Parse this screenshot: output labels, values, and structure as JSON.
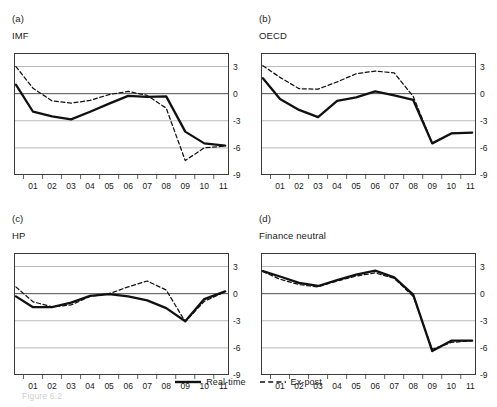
{
  "figure": {
    "caption": "Figure 6.2",
    "legend": [
      {
        "label": "Real-time",
        "style": "solid",
        "color": "#111111"
      },
      {
        "label": "Ex-post",
        "style": "dashed",
        "color": "#111111"
      }
    ]
  },
  "axis": {
    "y_ticks": [
      "3",
      "0",
      "-3",
      "-6",
      "-9"
    ],
    "y_values": [
      3,
      0,
      -3,
      -6,
      -9
    ],
    "x_ticks": [
      "01",
      "02",
      "03",
      "04",
      "05",
      "06",
      "07",
      "08",
      "09",
      "10",
      "11"
    ],
    "ylim": [
      -9,
      4.5
    ],
    "xlim": [
      0.5,
      11.8
    ],
    "grid": true,
    "zero_line": true
  },
  "panels": [
    {
      "index": "(a)",
      "title": "IMF"
    },
    {
      "index": "(b)",
      "title": "OECD"
    },
    {
      "index": "(c)",
      "title": "HP"
    },
    {
      "index": "(d)",
      "title": "Finance neutral"
    }
  ],
  "chart_data": [
    {
      "type": "line",
      "title": "IMF",
      "panel": "(a)",
      "xlabel": "",
      "ylabel": "",
      "ylim": [
        -9,
        4.5
      ],
      "grid": true,
      "x": [
        0.6,
        1.5,
        2.5,
        3.5,
        4.5,
        5.5,
        6.5,
        7.5,
        8.5,
        9.5,
        10.5,
        11.6
      ],
      "series": [
        {
          "name": "Real-time",
          "style": "solid",
          "values": [
            1.0,
            -2.0,
            -2.5,
            -2.85,
            -2.0,
            -1.1,
            -0.25,
            -0.35,
            -0.3,
            -4.2,
            -5.5,
            -5.75
          ]
        },
        {
          "name": "Ex-post",
          "style": "dashed",
          "values": [
            3.0,
            0.6,
            -0.8,
            -1.05,
            -0.75,
            -0.1,
            0.25,
            -0.2,
            -1.6,
            -7.4,
            -6.0,
            -5.8
          ]
        }
      ]
    },
    {
      "type": "line",
      "title": "OECD",
      "panel": "(b)",
      "xlabel": "",
      "ylabel": "",
      "ylim": [
        -9,
        4.5
      ],
      "grid": true,
      "x": [
        0.6,
        1.5,
        2.5,
        3.5,
        4.5,
        5.5,
        6.5,
        7.5,
        8.5,
        9.5,
        10.5,
        11.6
      ],
      "series": [
        {
          "name": "Real-time",
          "style": "solid",
          "values": [
            1.7,
            -0.6,
            -1.8,
            -2.6,
            -0.8,
            -0.4,
            0.25,
            -0.2,
            -0.7,
            -5.5,
            -4.4,
            -4.3
          ]
        },
        {
          "name": "Ex-post",
          "style": "dashed",
          "values": [
            3.1,
            1.8,
            0.55,
            0.5,
            1.3,
            2.2,
            2.5,
            2.3,
            -0.3,
            -5.5,
            -4.4,
            -4.3
          ]
        }
      ]
    },
    {
      "type": "line",
      "title": "HP",
      "panel": "(c)",
      "xlabel": "",
      "ylabel": "",
      "ylim": [
        -9,
        4.5
      ],
      "grid": true,
      "x": [
        0.6,
        1.5,
        2.5,
        3.5,
        4.5,
        5.5,
        6.5,
        7.5,
        8.5,
        9.5,
        10.5,
        11.6
      ],
      "series": [
        {
          "name": "Real-time",
          "style": "solid",
          "values": [
            -0.3,
            -1.5,
            -1.5,
            -1.0,
            -0.25,
            -0.05,
            -0.3,
            -0.75,
            -1.6,
            -3.05,
            -0.6,
            0.25
          ]
        },
        {
          "name": "Ex-post",
          "style": "dashed",
          "values": [
            0.75,
            -0.9,
            -1.45,
            -1.25,
            -0.3,
            0.0,
            0.75,
            1.4,
            0.4,
            -3.1,
            -0.85,
            0.2
          ]
        }
      ]
    },
    {
      "type": "line",
      "title": "Finance neutral",
      "panel": "(d)",
      "xlabel": "",
      "ylabel": "",
      "ylim": [
        -9,
        4.5
      ],
      "grid": true,
      "x": [
        0.6,
        1.5,
        2.5,
        3.5,
        4.5,
        5.5,
        6.5,
        7.5,
        8.5,
        9.5,
        10.5,
        11.6
      ],
      "series": [
        {
          "name": "Real-time",
          "style": "solid",
          "values": [
            2.5,
            1.9,
            1.2,
            0.85,
            1.5,
            2.1,
            2.55,
            1.8,
            -0.1,
            -6.35,
            -5.2,
            -5.2
          ]
        },
        {
          "name": "Ex-post",
          "style": "dashed",
          "values": [
            2.45,
            1.6,
            1.0,
            0.75,
            1.4,
            1.95,
            2.3,
            1.7,
            -0.3,
            -6.15,
            -5.4,
            -5.2
          ]
        }
      ]
    }
  ]
}
